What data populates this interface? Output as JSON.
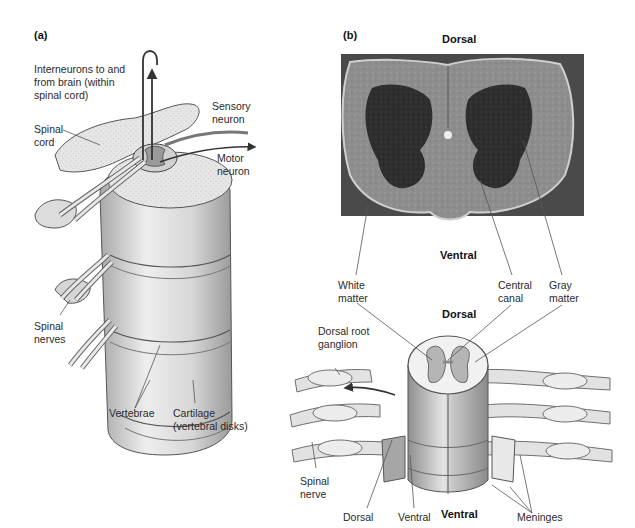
{
  "figure": {
    "panel_a": {
      "tag": "(a)",
      "labels": {
        "interneurons": "Interneurons to and\nfrom brain (within\nspinal cord)",
        "spinal_cord": "Spinal\ncord",
        "sensory_neuron": "Sensory\nneuron",
        "motor_neuron": "Motor\nneuron",
        "spinal_nerves": "Spinal\nnerves",
        "vertebrae": "Vertebrae",
        "cartilage": "Cartilage\n(vertebral disks)"
      }
    },
    "panel_b": {
      "tag": "(b)",
      "micrograph": {
        "top": "Dorsal",
        "bottom": "Ventral",
        "white_matter": "White\nmatter",
        "central_canal": "Central\ncanal",
        "gray_matter": "Gray\nmatter"
      },
      "illustration": {
        "top": "Dorsal",
        "bottom": "Ventral",
        "dorsal_root_ganglion": "Dorsal root\nganglion",
        "spinal_nerve": "Spinal\nnerve",
        "dorsal": "Dorsal",
        "ventral": "Ventral",
        "meninges": "Meninges"
      }
    }
  }
}
